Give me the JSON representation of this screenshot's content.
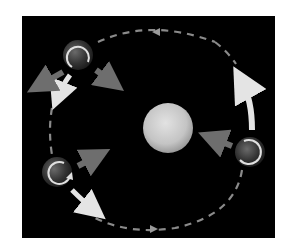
{
  "diagram": {
    "colors": {
      "background": "#000000",
      "page": "#ffffff",
      "orbit": "#8a8a8a",
      "orbit_arrow": "#d8d8d8",
      "sun": "#c8c8c8",
      "planet": "#3a3a3a",
      "gray_arrow": "#6e6e6e"
    },
    "sun": {
      "cx": 168,
      "cy": 128,
      "r": 25
    },
    "orbit": {
      "cx": 150,
      "cy": 128,
      "rx": 100,
      "ry": 97
    },
    "planets": [
      {
        "name": "top-left",
        "cx": 78,
        "cy": 55,
        "r": 15
      },
      {
        "name": "bottom-left",
        "cx": 57,
        "cy": 172,
        "r": 15
      },
      {
        "name": "right",
        "cx": 250,
        "cy": 152,
        "r": 15
      }
    ]
  }
}
